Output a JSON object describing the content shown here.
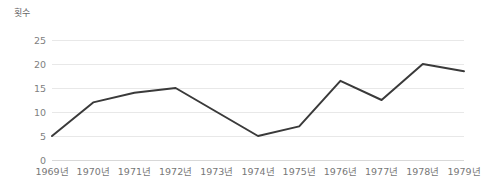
{
  "chart_data": {
    "type": "line",
    "title": "",
    "subtitle": "",
    "xlabel": "",
    "ylabel": "횟수",
    "categories": [
      "1969년",
      "1970년",
      "1971년",
      "1972년",
      "1973년",
      "1974년",
      "1975년",
      "1976년",
      "1977년",
      "1978년",
      "1979년"
    ],
    "values": [
      5,
      12,
      14,
      15,
      10,
      5,
      7,
      16.5,
      12.5,
      20,
      18.5
    ],
    "series": [
      {
        "name": "횟수",
        "values": [
          5,
          12,
          14,
          15,
          10,
          5,
          7,
          16.5,
          12.5,
          20,
          18.5
        ]
      }
    ],
    "ylim": [
      0,
      25
    ],
    "yticks": [
      0,
      5,
      10,
      15,
      20,
      25
    ],
    "ytick_labels": [
      "0",
      "5",
      "10",
      "15",
      "20",
      "25"
    ],
    "grid": true,
    "grid_axis": "y",
    "legend": false,
    "legend_position": "none",
    "line_color": "#3a3a3a",
    "line_width": 2,
    "markers": false,
    "grid_color": "#e8e8e8",
    "background_color": "#ffffff",
    "tick_label_color": "#808080",
    "axis_label_color": "#666666"
  }
}
